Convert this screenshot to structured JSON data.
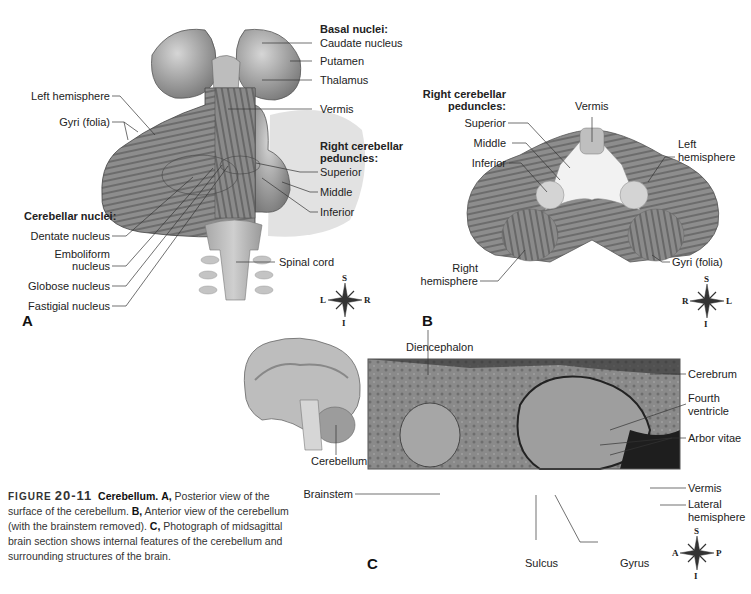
{
  "figure": {
    "number_prefix": "FIGURE",
    "number": "20-11",
    "title": "Cerebellum.",
    "caption_parts": [
      {
        "bold": "A,",
        "text": " Posterior view of the surface of the cerebellum. "
      },
      {
        "bold": "B,",
        "text": " Anterior view of the cerebellum (with the brainstem removed). "
      },
      {
        "bold": "C,",
        "text": " Photograph of midsagittal brain section shows internal features of the cerebellum and surrounding structures of the brain."
      }
    ]
  },
  "panel_a": {
    "letter": "A",
    "labels": {
      "left_hemisphere": "Left hemisphere",
      "gyri": "Gyri (folia)",
      "cerebellar_nuclei_heading": "Cerebellar nuclei:",
      "dentate": "Dentate nucleus",
      "emboliform_1": "Emboliform",
      "emboliform_2": "nucleus",
      "globose": "Globose nucleus",
      "fastigial": "Fastigial nucleus",
      "basal_nuclei_heading": "Basal nuclei:",
      "caudate": "Caudate nucleus",
      "putamen": "Putamen",
      "thalamus": "Thalamus",
      "vermis": "Vermis",
      "peduncles_heading_1": "Right cerebellar",
      "peduncles_heading_2": "peduncles:",
      "superior": "Superior",
      "middle": "Middle",
      "inferior": "Inferior",
      "spinal_cord": "Spinal cord"
    },
    "compass": {
      "top": "S",
      "bottom": "I",
      "left": "L",
      "right": "R"
    }
  },
  "panel_b": {
    "letter": "B",
    "labels": {
      "peduncles_heading_1": "Right cerebellar",
      "peduncles_heading_2": "peduncles:",
      "superior": "Superior",
      "middle": "Middle",
      "inferior": "Inferior",
      "vermis": "Vermis",
      "left_hemisphere_1": "Left",
      "left_hemisphere_2": "hemisphere",
      "right_hemisphere_1": "Right",
      "right_hemisphere_2": "hemisphere",
      "gyri": "Gyri (folia)"
    },
    "compass": {
      "top": "S",
      "bottom": "I",
      "left": "R",
      "right": "L"
    }
  },
  "panel_c": {
    "letter": "C",
    "labels": {
      "cerebellum": "Cerebellum",
      "brainstem": "Brainstem",
      "diencephalon": "Diencephalon",
      "cerebrum": "Cerebrum",
      "fourth_ventricle_1": "Fourth",
      "fourth_ventricle_2": "ventricle",
      "arbor_vitae": "Arbor vitae",
      "vermis": "Vermis",
      "lateral_hemisphere_1": "Lateral",
      "lateral_hemisphere_2": "hemisphere",
      "sulcus": "Sulcus",
      "gyrus": "Gyrus"
    },
    "compass": {
      "top": "S",
      "bottom": "I",
      "left": "A",
      "right": "P"
    }
  }
}
